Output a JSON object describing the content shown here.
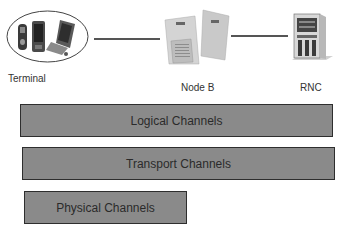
{
  "diagram": {
    "nodes": [
      {
        "id": "terminal",
        "label": "Terminal",
        "icon": "mobile-devices-icon"
      },
      {
        "id": "nodeb",
        "label": "Node B",
        "icon": "base-station-icon"
      },
      {
        "id": "rnc",
        "label": "RNC",
        "icon": "server-rack-icon"
      }
    ],
    "links": [
      {
        "from": "terminal",
        "to": "nodeb"
      },
      {
        "from": "nodeb",
        "to": "rnc"
      }
    ],
    "layers": [
      {
        "label": "Logical Channels"
      },
      {
        "label": "Transport Channels"
      },
      {
        "label": "Physical Channels"
      }
    ],
    "colors": {
      "bar_fill": "#8a8a8a",
      "bar_border": "#2e2e2e",
      "line": "#555555",
      "text": "#333333"
    }
  }
}
